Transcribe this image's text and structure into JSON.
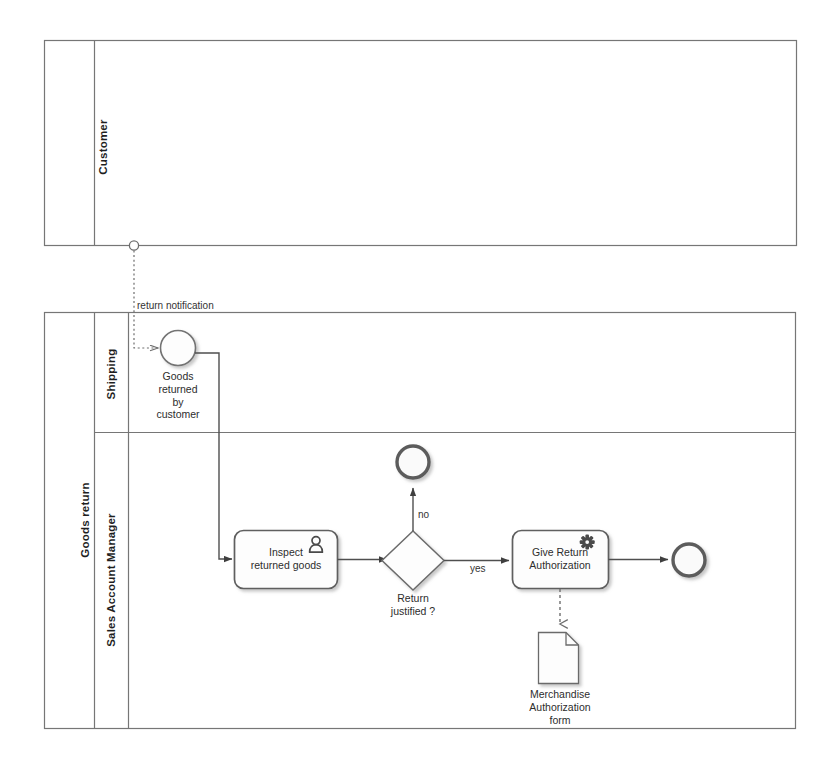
{
  "diagram": {
    "type": "bpmn-collaboration"
  },
  "pools": [
    {
      "id": "customer",
      "label": "Customer",
      "lanes": []
    },
    {
      "id": "goods-return",
      "label": "Goods return",
      "lanes": [
        {
          "id": "shipping",
          "label": "Shipping"
        },
        {
          "id": "sales-account-manager",
          "label": "Sales Account Manager"
        }
      ]
    }
  ],
  "nodes": {
    "start_event": {
      "type": "message-start-event",
      "label_lines": [
        "Goods",
        "returned",
        "by",
        "customer"
      ],
      "lane": "shipping"
    },
    "task_inspect": {
      "type": "user-task",
      "label_lines": [
        "Inspect",
        "returned goods"
      ],
      "icon": "user-icon",
      "lane": "sales-account-manager"
    },
    "gateway_return": {
      "type": "exclusive-gateway",
      "label_lines": [
        "Return",
        "justified ?"
      ],
      "lane": "sales-account-manager"
    },
    "end_no": {
      "type": "end-event",
      "label": "",
      "lane": "sales-account-manager"
    },
    "task_authorization": {
      "type": "service-task",
      "label_lines": [
        "Give Return",
        "Authorization"
      ],
      "icon": "gear-icon",
      "lane": "sales-account-manager"
    },
    "end_yes": {
      "type": "end-event",
      "label": "",
      "lane": "sales-account-manager"
    },
    "data_object": {
      "type": "data-object",
      "label_lines": [
        "Merchandise",
        "Authorization",
        "form"
      ],
      "lane": "sales-account-manager"
    }
  },
  "flows": {
    "message_flow": {
      "label": "return notification",
      "from": "customer",
      "to": "start_event"
    },
    "gateway_no": {
      "label": "no",
      "from": "gateway_return",
      "to": "end_no"
    },
    "gateway_yes": {
      "label": "yes",
      "from": "gateway_return",
      "to": "task_authorization"
    }
  },
  "colors": {
    "stroke": "#636363",
    "pool_border": "#767676",
    "text": "#2d2d2d",
    "background": "#ffffff"
  }
}
